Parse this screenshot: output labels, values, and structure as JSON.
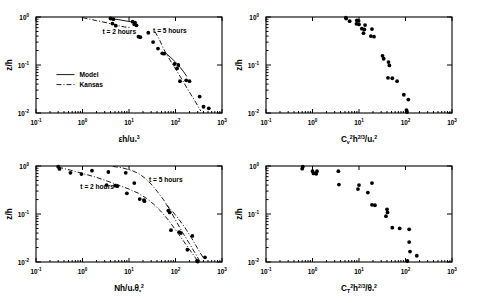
{
  "figure": {
    "title": "",
    "panel_count": 4,
    "background": "#ffffff",
    "ink": "#000000"
  },
  "chart_data": [
    {
      "id": "panel-top-left",
      "type": "scatter",
      "title": "",
      "xlabel": "εh/uₓ³",
      "xlabel_parts": {
        "base": "εh/u",
        "sub": "*",
        "sup": "3"
      },
      "ylabel": "z/h",
      "xscale": "log",
      "yscale": "log",
      "xlim": [
        0.1,
        1000
      ],
      "ylim": [
        0.01,
        1
      ],
      "xticklabels": [
        "10⁻¹",
        "10⁰",
        "10¹",
        "10²",
        "10³"
      ],
      "xtickexp": [
        "-1",
        "0",
        "1",
        "2",
        "3"
      ],
      "yticklabels": [
        "10⁰",
        "10⁻¹",
        "10⁻²"
      ],
      "ytickexp": [
        "0",
        "-1",
        "-2"
      ],
      "grid": false,
      "legend_position": "center-left",
      "legend": [
        {
          "label": "Model",
          "style": "solid"
        },
        {
          "label": "Kansas",
          "style": "dash-dot"
        }
      ],
      "annotations": [
        {
          "text": "t = 2 hours",
          "x": 2.7,
          "y": 0.44
        },
        {
          "text": "t = 5 hours",
          "x": 33,
          "y": 0.47
        }
      ],
      "points": [
        {
          "x": 4.0,
          "y": 0.93
        },
        {
          "x": 4.6,
          "y": 0.9
        },
        {
          "x": 4.4,
          "y": 0.73
        },
        {
          "x": 5.2,
          "y": 0.66
        },
        {
          "x": 12.0,
          "y": 0.8
        },
        {
          "x": 13.5,
          "y": 0.76
        },
        {
          "x": 13.0,
          "y": 0.7
        },
        {
          "x": 14.5,
          "y": 0.67
        },
        {
          "x": 16.0,
          "y": 0.39
        },
        {
          "x": 17.5,
          "y": 0.38
        },
        {
          "x": 26.0,
          "y": 0.47
        },
        {
          "x": 33.0,
          "y": 0.3
        },
        {
          "x": 42.0,
          "y": 0.22
        },
        {
          "x": 52.0,
          "y": 0.175
        },
        {
          "x": 57.0,
          "y": 0.172
        },
        {
          "x": 95.0,
          "y": 0.105
        },
        {
          "x": 115.0,
          "y": 0.1
        },
        {
          "x": 108.0,
          "y": 0.085
        },
        {
          "x": 125.0,
          "y": 0.046
        },
        {
          "x": 170.0,
          "y": 0.048
        },
        {
          "x": 200.0,
          "y": 0.046
        },
        {
          "x": 330.0,
          "y": 0.022
        },
        {
          "x": 400.0,
          "y": 0.0135
        },
        {
          "x": 520.0,
          "y": 0.0125
        }
      ],
      "curves": [
        {
          "name": "Model-2h",
          "style": "solid",
          "path": [
            [
              4.0,
              0.93
            ],
            [
              6.0,
              0.88
            ],
            [
              9.0,
              0.82
            ],
            [
              12.5,
              0.78
            ]
          ]
        },
        {
          "name": "Kansas-2h",
          "style": "dash-dot",
          "path": [
            [
              1.0,
              0.97
            ],
            [
              2.0,
              0.84
            ],
            [
              3.5,
              0.75
            ],
            [
              5.5,
              0.67
            ],
            [
              8.0,
              0.62
            ],
            [
              11.0,
              0.6
            ]
          ]
        },
        {
          "name": "Model-5h",
          "style": "solid",
          "path": [
            [
              62,
              0.175
            ],
            [
              78,
              0.145
            ],
            [
              100,
              0.115
            ],
            [
              125,
              0.09
            ],
            [
              150,
              0.072
            ],
            [
              175,
              0.058
            ]
          ]
        },
        {
          "name": "Kansas-5h",
          "style": "dash-dot",
          "path": [
            [
              36,
              0.5
            ],
            [
              45,
              0.34
            ],
            [
              55,
              0.22
            ],
            [
              70,
              0.145
            ],
            [
              95,
              0.09
            ],
            [
              130,
              0.055
            ],
            [
              180,
              0.032
            ],
            [
              260,
              0.018
            ],
            [
              350,
              0.011
            ]
          ]
        }
      ]
    },
    {
      "id": "panel-top-right",
      "type": "scatter",
      "title": "",
      "xlabel": "Cᵥ²h²ᐟ³/uₓ²",
      "xlabel_parts": {
        "base": "C",
        "sub1": "v",
        "sup1": "2",
        "mid": "h",
        "sup2": "2/3",
        "div": "/u",
        "sub2": "*",
        "sup3": "2"
      },
      "ylabel": "z/h",
      "xscale": "log",
      "yscale": "log",
      "xlim": [
        0.1,
        1000
      ],
      "ylim": [
        0.01,
        1
      ],
      "xticklabels": [
        "10⁻¹",
        "10⁰",
        "10¹",
        "10²",
        "10³"
      ],
      "xtickexp": [
        "-1",
        "0",
        "1",
        "2",
        "3"
      ],
      "yticklabels": [
        "10⁰",
        "10⁻¹",
        "10⁻²"
      ],
      "ytickexp": [
        "0",
        "-1",
        "-2"
      ],
      "grid": false,
      "legend": [],
      "annotations": [],
      "points": [
        {
          "x": 5.2,
          "y": 0.97
        },
        {
          "x": 5.3,
          "y": 0.93
        },
        {
          "x": 6.3,
          "y": 0.82
        },
        {
          "x": 9.0,
          "y": 0.85
        },
        {
          "x": 9.8,
          "y": 0.83
        },
        {
          "x": 8.8,
          "y": 0.72
        },
        {
          "x": 10.0,
          "y": 0.7
        },
        {
          "x": 13.5,
          "y": 0.68
        },
        {
          "x": 11.5,
          "y": 0.57
        },
        {
          "x": 13.0,
          "y": 0.55
        },
        {
          "x": 19.0,
          "y": 0.56
        },
        {
          "x": 12.5,
          "y": 0.46
        },
        {
          "x": 18.0,
          "y": 0.4
        },
        {
          "x": 21.0,
          "y": 0.39
        },
        {
          "x": 32.0,
          "y": 0.155
        },
        {
          "x": 34.0,
          "y": 0.135
        },
        {
          "x": 43.0,
          "y": 0.115
        },
        {
          "x": 45.0,
          "y": 0.098
        },
        {
          "x": 42.0,
          "y": 0.054
        },
        {
          "x": 52.0,
          "y": 0.053
        },
        {
          "x": 66.0,
          "y": 0.046
        },
        {
          "x": 92.0,
          "y": 0.024
        },
        {
          "x": 115.0,
          "y": 0.019
        },
        {
          "x": 105.0,
          "y": 0.0115
        },
        {
          "x": 108.0,
          "y": 0.0105
        }
      ],
      "curves": []
    },
    {
      "id": "panel-bottom-left",
      "type": "scatter",
      "title": "",
      "xlabel": "Nh/uₓθₓ²",
      "xlabel_parts": {
        "base": "Nh/u",
        "sub1": "*",
        "theta": "θ",
        "sub2": "*",
        "sup": "2"
      },
      "ylabel": "z/h",
      "xscale": "log",
      "yscale": "log",
      "xlim": [
        0.1,
        1000
      ],
      "ylim": [
        0.01,
        1
      ],
      "xticklabels": [
        "10⁻¹",
        "10⁰",
        "10¹",
        "10²",
        "10³"
      ],
      "xtickexp": [
        "-1",
        "0",
        "1",
        "2",
        "3"
      ],
      "yticklabels": [
        "10⁰",
        "10⁻¹",
        "10⁻²"
      ],
      "ytickexp": [
        "0",
        "-1",
        "-2"
      ],
      "grid": false,
      "legend": [],
      "annotations": [
        {
          "text": "t = 2 hours",
          "x": 0.9,
          "y": 0.33
        },
        {
          "text": "t = 5 hours",
          "x": 27,
          "y": 0.47
        }
      ],
      "points": [
        {
          "x": 0.3,
          "y": 0.97
        },
        {
          "x": 0.32,
          "y": 0.87
        },
        {
          "x": 0.55,
          "y": 0.72
        },
        {
          "x": 0.95,
          "y": 0.68
        },
        {
          "x": 1.6,
          "y": 0.8
        },
        {
          "x": 3.6,
          "y": 0.75
        },
        {
          "x": 3.3,
          "y": 0.4
        },
        {
          "x": 5.0,
          "y": 0.39
        },
        {
          "x": 5.6,
          "y": 0.38
        },
        {
          "x": 8.5,
          "y": 0.72
        },
        {
          "x": 9.0,
          "y": 0.27
        },
        {
          "x": 13.0,
          "y": 0.44
        },
        {
          "x": 17.0,
          "y": 0.205
        },
        {
          "x": 21.0,
          "y": 0.195
        },
        {
          "x": 21.5,
          "y": 0.185
        },
        {
          "x": 70.0,
          "y": 0.118
        },
        {
          "x": 75.0,
          "y": 0.108
        },
        {
          "x": 80.0,
          "y": 0.046
        },
        {
          "x": 120.0,
          "y": 0.042
        },
        {
          "x": 130.0,
          "y": 0.04
        },
        {
          "x": 230.0,
          "y": 0.035
        },
        {
          "x": 180.0,
          "y": 0.018
        },
        {
          "x": 290.0,
          "y": 0.0105
        },
        {
          "x": 300.0,
          "y": 0.0102
        },
        {
          "x": 430.0,
          "y": 0.0125
        }
      ],
      "curves": [
        {
          "name": "Kansas-2h",
          "style": "dash-dot",
          "path": [
            [
              0.3,
              0.95
            ],
            [
              0.55,
              0.82
            ],
            [
              1.0,
              0.7
            ],
            [
              2.0,
              0.58
            ],
            [
              3.5,
              0.48
            ],
            [
              6.0,
              0.4
            ],
            [
              10,
              0.33
            ],
            [
              16,
              0.27
            ],
            [
              24,
              0.21
            ],
            [
              34,
              0.16
            ],
            [
              48,
              0.115
            ],
            [
              70,
              0.075
            ],
            [
              100,
              0.047
            ],
            [
              150,
              0.027
            ],
            [
              220,
              0.016
            ],
            [
              300,
              0.0105
            ]
          ]
        },
        {
          "name": "Model-2h",
          "style": "dash-dot",
          "path": [
            [
              4.5,
              0.98
            ],
            [
              7.0,
              0.92
            ],
            [
              11,
              0.82
            ],
            [
              16,
              0.7
            ],
            [
              22,
              0.56
            ],
            [
              30,
              0.42
            ],
            [
              40,
              0.3
            ],
            [
              55,
              0.2
            ],
            [
              75,
              0.125
            ],
            [
              100,
              0.075
            ],
            [
              140,
              0.042
            ],
            [
              200,
              0.024
            ],
            [
              280,
              0.014
            ],
            [
              330,
              0.0105
            ]
          ]
        },
        {
          "name": "Model-5h",
          "style": "dash-dot",
          "path": [
            [
              62,
              0.16
            ],
            [
              85,
              0.115
            ],
            [
              115,
              0.08
            ],
            [
              160,
              0.052
            ],
            [
              220,
              0.032
            ],
            [
              300,
              0.019
            ],
            [
              400,
              0.012
            ]
          ]
        }
      ]
    },
    {
      "id": "panel-bottom-right",
      "type": "scatter",
      "title": "",
      "xlabel": "Cₜ²h²ᐟ³/θₓ²",
      "xlabel_parts": {
        "base": "C",
        "sub1": "T",
        "sup1": "2",
        "mid": "h",
        "sup2": "2/3",
        "div": "/",
        "theta": "θ",
        "sub2": "*",
        "sup3": "2"
      },
      "ylabel": "z/h",
      "xscale": "log",
      "yscale": "log",
      "xlim": [
        0.1,
        1000
      ],
      "ylim": [
        0.01,
        1
      ],
      "xticklabels": [
        "10⁻¹",
        "10⁰",
        "10¹",
        "10²",
        "10³"
      ],
      "xtickexp": [
        "-1",
        "0",
        "1",
        "2",
        "3"
      ],
      "yticklabels": [
        "10⁰",
        "10⁻¹",
        "10⁻²"
      ],
      "ytickexp": [
        "0",
        "-1",
        "-2"
      ],
      "grid": false,
      "legend": [],
      "annotations": [],
      "points": [
        {
          "x": 0.62,
          "y": 0.97
        },
        {
          "x": 0.6,
          "y": 0.88
        },
        {
          "x": 1.0,
          "y": 0.78
        },
        {
          "x": 1.25,
          "y": 0.78
        },
        {
          "x": 1.05,
          "y": 0.7
        },
        {
          "x": 1.2,
          "y": 0.69
        },
        {
          "x": 3.6,
          "y": 0.78
        },
        {
          "x": 3.7,
          "y": 0.41
        },
        {
          "x": 10.0,
          "y": 0.4
        },
        {
          "x": 9.5,
          "y": 0.33
        },
        {
          "x": 19.0,
          "y": 0.44
        },
        {
          "x": 15.5,
          "y": 0.28
        },
        {
          "x": 19.0,
          "y": 0.155
        },
        {
          "x": 22.0,
          "y": 0.152
        },
        {
          "x": 40.0,
          "y": 0.125
        },
        {
          "x": 41.0,
          "y": 0.108
        },
        {
          "x": 38.0,
          "y": 0.09
        },
        {
          "x": 52.0,
          "y": 0.052
        },
        {
          "x": 75.0,
          "y": 0.05
        },
        {
          "x": 120.0,
          "y": 0.048
        },
        {
          "x": 120.0,
          "y": 0.026
        },
        {
          "x": 125.0,
          "y": 0.0165
        },
        {
          "x": 110.0,
          "y": 0.0105
        },
        {
          "x": 175.0,
          "y": 0.0135
        }
      ],
      "curves": []
    }
  ]
}
